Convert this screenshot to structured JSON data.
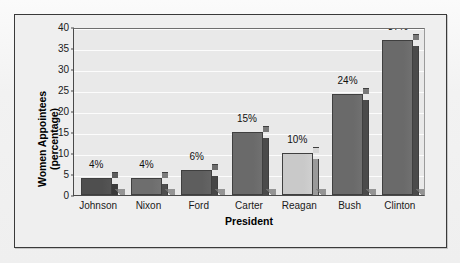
{
  "chart_data": {
    "type": "bar",
    "title": "",
    "subtitle": "",
    "xlabel": "President",
    "ylabel": "Women Appointees (percentage)",
    "ylabel_line1": "Women Appointees",
    "ylabel_line2": "(percentage)",
    "categories": [
      "Johnson",
      "Nixon",
      "Ford",
      "Carter",
      "Reagan",
      "Bush",
      "Clinton"
    ],
    "values": [
      4,
      4,
      6,
      15,
      10,
      24,
      37
    ],
    "data_labels": [
      "4%",
      "4%",
      "6%",
      "15%",
      "10%",
      "24%",
      "37%"
    ],
    "ylim": [
      0,
      40
    ],
    "ytick_values": [
      0,
      5,
      10,
      15,
      20,
      25,
      30,
      35,
      40
    ],
    "ytick_labels": [
      "0",
      "5",
      "10",
      "15",
      "20",
      "25",
      "30",
      "35",
      "40"
    ],
    "grid": true,
    "grid_axis": "y",
    "legend": false,
    "legend_position": "none",
    "style": "3d-bars",
    "bar_colors": [
      "#4f4f4f",
      "#6e6e6e",
      "#5e5e5e",
      "#6a6a6a",
      "#c9c9c9",
      "#6a6a6a",
      "#6a6a6a"
    ],
    "bar_side_colors": [
      "#3a3a3a",
      "#4e4e4e",
      "#464646",
      "#4b4b4b",
      "#9a9a9a",
      "#4b4b4b",
      "#4b4b4b"
    ]
  },
  "figure": {
    "background_color": "#efefef",
    "plot_background_color": "#e9e9e9",
    "frame_color": "#3a3a3a",
    "gridline_color": "#ffffff",
    "axis_color": "#4a4a4a",
    "text_color": "#1a1a1a"
  }
}
